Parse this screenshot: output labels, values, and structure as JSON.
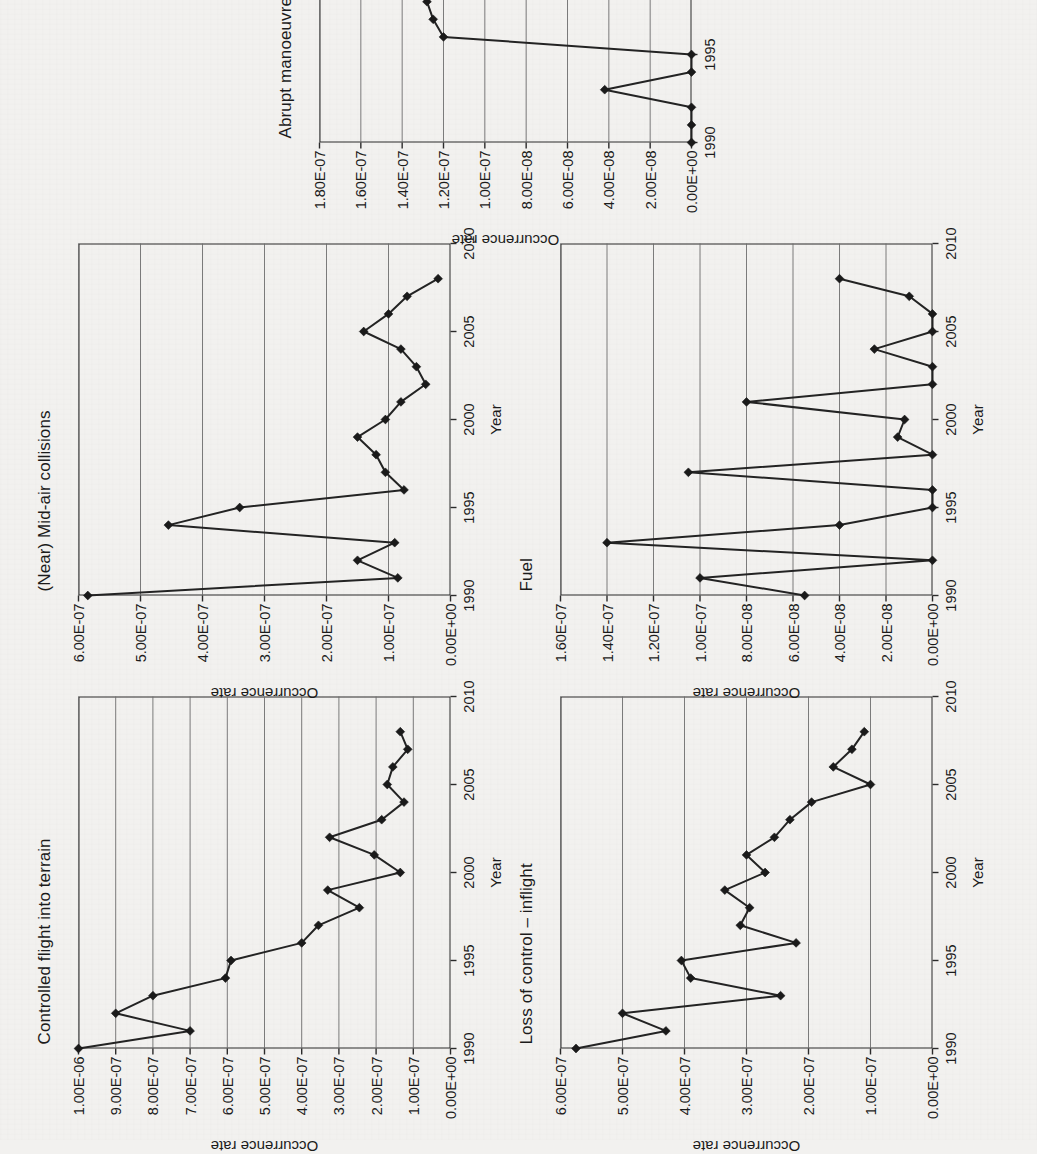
{
  "figure": {
    "rotation_degrees": -90,
    "background_color": "#f2f1ef",
    "line_color": "#232323",
    "grid_color": "#6d6d6d",
    "panel_count": 5
  },
  "chart_data": [
    {
      "id": "cfit",
      "type": "line",
      "title": "Controlled flight into terrain",
      "xlabel": "Year",
      "ylabel": "Occurrence rate",
      "xlim": [
        1990,
        2010
      ],
      "ylim": [
        0,
        1e-06
      ],
      "grid": true,
      "legend": "none",
      "xticks": [
        "1990",
        "1995",
        "2000",
        "2005",
        "2010"
      ],
      "xtick_values": [
        1990,
        1995,
        2000,
        2005,
        2010
      ],
      "yticks": [
        "0.00E+00",
        "1.00E-07",
        "2.00E-07",
        "3.00E-07",
        "4.00E-07",
        "5.00E-07",
        "6.00E-07",
        "7.00E-07",
        "8.00E-07",
        "9.00E-07",
        "1.00E-06"
      ],
      "ytick_values": [
        0,
        1e-07,
        2e-07,
        3e-07,
        4e-07,
        5e-07,
        6e-07,
        7e-07,
        8e-07,
        9e-07,
        1e-06
      ],
      "x": [
        1990,
        1991,
        1992,
        1993,
        1994,
        1995,
        1996,
        1997,
        1998,
        1999,
        2000,
        2001,
        2002,
        2003,
        2004,
        2005,
        2006,
        2007,
        2008
      ],
      "values": [
        1e-06,
        7e-07,
        9e-07,
        8e-07,
        6.05e-07,
        5.9e-07,
        4e-07,
        3.55e-07,
        2.45e-07,
        3.3e-07,
        1.35e-07,
        2.05e-07,
        3.25e-07,
        1.85e-07,
        1.25e-07,
        1.7e-07,
        1.55e-07,
        1.15e-07,
        1.35e-07
      ]
    },
    {
      "id": "loc_i",
      "type": "line",
      "title": "Loss of control – inflight",
      "xlabel": "Year",
      "ylabel": "Occurrence rate",
      "xlim": [
        1990,
        2010
      ],
      "ylim": [
        0,
        6e-07
      ],
      "grid": true,
      "legend": "none",
      "xticks": [
        "1990",
        "1995",
        "2000",
        "2005",
        "2010"
      ],
      "xtick_values": [
        1990,
        1995,
        2000,
        2005,
        2010
      ],
      "yticks": [
        "0.00E+00",
        "1.00E-07",
        "2.00E-07",
        "3.00E-07",
        "4.00E-07",
        "5.00E-07",
        "6.00E-07"
      ],
      "ytick_values": [
        0,
        1e-07,
        2e-07,
        3e-07,
        4e-07,
        5e-07,
        6e-07
      ],
      "x": [
        1990,
        1991,
        1992,
        1993,
        1994,
        1995,
        1996,
        1997,
        1998,
        1999,
        2000,
        2001,
        2002,
        2003,
        2004,
        2005,
        2006,
        2007,
        2008
      ],
      "values": [
        5.75e-07,
        4.3e-07,
        5e-07,
        2.45e-07,
        3.9e-07,
        4.05e-07,
        2.2e-07,
        3.1e-07,
        2.95e-07,
        3.35e-07,
        2.7e-07,
        3e-07,
        2.55e-07,
        2.3e-07,
        1.95e-07,
        1e-07,
        1.6e-07,
        1.3e-07,
        1.1e-07
      ]
    },
    {
      "id": "midair",
      "type": "line",
      "title": "(Near) Mid-air collisions",
      "xlabel": "Year",
      "ylabel": "Occurrence rate",
      "xlim": [
        1990,
        2010
      ],
      "ylim": [
        0,
        6e-07
      ],
      "grid": true,
      "legend": "none",
      "xticks": [
        "1990",
        "1995",
        "2000",
        "2005",
        "2010"
      ],
      "xtick_values": [
        1990,
        1995,
        2000,
        2005,
        2010
      ],
      "yticks": [
        "0.00E+00",
        "1.00E-07",
        "2.00E-07",
        "3.00E-07",
        "4.00E-07",
        "5.00E-07",
        "6.00E-07"
      ],
      "ytick_values": [
        0,
        1e-07,
        2e-07,
        3e-07,
        4e-07,
        5e-07,
        6e-07
      ],
      "x": [
        1990,
        1991,
        1992,
        1993,
        1994,
        1995,
        1996,
        1997,
        1998,
        1999,
        2000,
        2001,
        2002,
        2003,
        2004,
        2005,
        2006,
        2007,
        2008
      ],
      "values": [
        5.85e-07,
        8.5e-08,
        1.5e-07,
        9e-08,
        4.55e-07,
        3.4e-07,
        7.5e-08,
        1.05e-07,
        1.2e-07,
        1.5e-07,
        1.05e-07,
        8e-08,
        4e-08,
        5.5e-08,
        8e-08,
        1.4e-07,
        1e-07,
        7e-08,
        2e-08
      ]
    },
    {
      "id": "fuel",
      "type": "line",
      "title": "Fuel",
      "xlabel": "Year",
      "ylabel": "Occurrence rate",
      "xlim": [
        1990,
        2010
      ],
      "ylim": [
        0,
        1.6e-07
      ],
      "grid": true,
      "legend": "none",
      "xticks": [
        "1990",
        "1995",
        "2000",
        "2005",
        "2010"
      ],
      "xtick_values": [
        1990,
        1995,
        2000,
        2005,
        2010
      ],
      "yticks": [
        "0.00E+00",
        "2.00E-08",
        "4.00E-08",
        "6.00E-08",
        "8.00E-08",
        "1.00E-07",
        "1.20E-07",
        "1.40E-07",
        "1.60E-07"
      ],
      "ytick_values": [
        0,
        2e-08,
        4e-08,
        6e-08,
        8e-08,
        1e-07,
        1.2e-07,
        1.4e-07,
        1.6e-07
      ],
      "x": [
        1990,
        1991,
        1992,
        1993,
        1994,
        1995,
        1996,
        1997,
        1998,
        1999,
        2000,
        2001,
        2002,
        2003,
        2004,
        2005,
        2006,
        2007,
        2008
      ],
      "values": [
        5.5e-08,
        1e-07,
        0.0,
        1.4e-07,
        4e-08,
        0.0,
        0.0,
        1.05e-07,
        0.0,
        1.5e-08,
        1.2e-08,
        8e-08,
        0.0,
        0.0,
        2.5e-08,
        0.0,
        0.0,
        1e-08,
        4e-08
      ]
    },
    {
      "id": "abrupt",
      "type": "line",
      "title": "Abrupt manoeuvre",
      "xlabel": "Year",
      "ylabel": "Occurrence rate",
      "xlim": [
        1990,
        2010
      ],
      "ylim": [
        0,
        1.8e-07
      ],
      "grid": true,
      "legend": "none",
      "xticks": [
        "1990",
        "1995",
        "2000",
        "2005",
        "2010"
      ],
      "xtick_values": [
        1990,
        1995,
        2000,
        2005,
        2010
      ],
      "yticks": [
        "0.00E+00",
        "2.00E-08",
        "4.00E-08",
        "6.00E-08",
        "8.00E-08",
        "1.00E-07",
        "1.20E-07",
        "1.40E-07",
        "1.60E-07",
        "1.80E-07"
      ],
      "ytick_values": [
        0,
        2e-08,
        4e-08,
        6e-08,
        8e-08,
        1e-07,
        1.2e-07,
        1.4e-07,
        1.6e-07,
        1.8e-07
      ],
      "x": [
        1990,
        1991,
        1992,
        1993,
        1994,
        1995,
        1996,
        1997,
        1998,
        1999,
        2000,
        2001,
        2002,
        2003,
        2004,
        2005,
        2006,
        2007,
        2008
      ],
      "values": [
        0.0,
        0.0,
        0.0,
        4.2e-08,
        0.0,
        0.0,
        1.2e-07,
        1.25e-07,
        1.28e-07,
        1.33e-07,
        1.6e-07,
        8e-08,
        4e-08,
        9e-08,
        6e-08,
        1e-07,
        2e-08,
        4e-08,
        2e-08
      ]
    }
  ]
}
